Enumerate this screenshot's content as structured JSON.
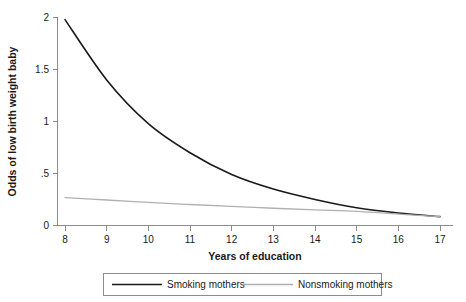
{
  "chart_data": {
    "type": "line",
    "title": "",
    "xlabel": "Years of education",
    "ylabel": "Odds of low birth weight baby",
    "xlim": [
      8,
      17
    ],
    "ylim": [
      0,
      2
    ],
    "grid": false,
    "legend_position": "bottom",
    "x": [
      8,
      9,
      10,
      11,
      12,
      13,
      14,
      15,
      16,
      17
    ],
    "xtick_labels": [
      "8",
      "9",
      "10",
      "11",
      "12",
      "13",
      "14",
      "15",
      "16",
      "17"
    ],
    "ytick_values": [
      0,
      0.5,
      1,
      1.5,
      2
    ],
    "ytick_labels": [
      "0",
      ".5",
      "1",
      "1.5",
      "2"
    ],
    "series": [
      {
        "name": "Smoking mothers",
        "color": "#1a1a1a",
        "width": 1.6,
        "values": [
          1.98,
          1.4,
          0.98,
          0.7,
          0.49,
          0.35,
          0.25,
          0.17,
          0.12,
          0.085
        ]
      },
      {
        "name": "Nonsmoking mothers",
        "color": "#b0b0b0",
        "width": 1.3,
        "values": [
          0.268,
          0.245,
          0.222,
          0.202,
          0.183,
          0.166,
          0.15,
          0.136,
          0.11,
          0.085
        ]
      }
    ]
  },
  "legend": {
    "entries": [
      {
        "label": "Smoking mothers"
      },
      {
        "label": "Nonsmoking mothers"
      }
    ]
  },
  "axes": {
    "x_title": "Years of education",
    "y_title": "Odds of low birth weight baby"
  }
}
